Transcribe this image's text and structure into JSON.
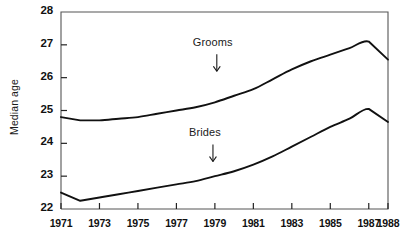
{
  "chart_data": {
    "type": "line",
    "title": "",
    "subtitle": "",
    "xlabel": "",
    "ylabel": "Median age",
    "xlim": [
      1971,
      1988
    ],
    "ylim": [
      22,
      28
    ],
    "grid": false,
    "legend_position": "inline-annotations",
    "x_tick_labels": [
      "1971",
      "1973",
      "1975",
      "1977",
      "1979",
      "1981",
      "1983",
      "1985",
      "1987",
      "1988"
    ],
    "x_tick_values": [
      1971,
      1973,
      1975,
      1977,
      1979,
      1981,
      1983,
      1985,
      1987,
      1988
    ],
    "y_tick_labels": [
      "22",
      "23",
      "24",
      "25",
      "26",
      "27",
      "28"
    ],
    "y_tick_values": [
      22,
      23,
      24,
      25,
      26,
      27,
      28
    ],
    "x": [
      1971,
      1972,
      1973,
      1974,
      1975,
      1976,
      1977,
      1978,
      1979,
      1980,
      1981,
      1982,
      1983,
      1984,
      1985,
      1986,
      1987,
      1988
    ],
    "series": [
      {
        "name": "Grooms",
        "color": "#111111",
        "annotation": "Grooms",
        "values": [
          24.8,
          24.7,
          24.7,
          24.75,
          24.8,
          24.9,
          25.0,
          25.1,
          25.25,
          25.45,
          25.65,
          25.95,
          26.25,
          26.5,
          26.7,
          26.9,
          27.1,
          26.55
        ]
      },
      {
        "name": "Brides",
        "color": "#111111",
        "annotation": "Brides",
        "values": [
          22.5,
          22.25,
          22.35,
          22.45,
          22.55,
          22.65,
          22.75,
          22.85,
          23.0,
          23.15,
          23.35,
          23.6,
          23.9,
          24.2,
          24.5,
          24.75,
          25.05,
          24.65
        ]
      }
    ],
    "annotations": [
      {
        "label": "Grooms",
        "x": 1979.1,
        "y": 27.05,
        "arrow": "down"
      },
      {
        "label": "Brides",
        "x": 1978.9,
        "y": 24.3,
        "arrow": "down"
      }
    ]
  },
  "axes": {
    "y_axis_title": "Median age"
  }
}
